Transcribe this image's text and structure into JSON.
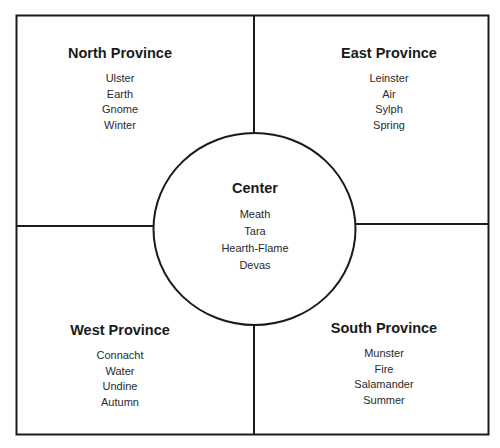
{
  "diagram": {
    "north": {
      "title": "North Province",
      "items": [
        "Ulster",
        "Earth",
        "Gnome",
        "Winter"
      ]
    },
    "east": {
      "title": "East Province",
      "items": [
        "Leinster",
        "Air",
        "Sylph",
        "Spring"
      ]
    },
    "center": {
      "title": "Center",
      "items": [
        "Meath",
        "Tara",
        "Hearth-Flame",
        "Devas"
      ]
    },
    "west": {
      "title": "West Province",
      "items": [
        "Connacht",
        "Water",
        "Undine",
        "Autumn"
      ]
    },
    "south": {
      "title": "South Province",
      "items": [
        "Munster",
        "Fire",
        "Salamander",
        "Summer"
      ]
    }
  },
  "colors": {
    "line": "#1a1a1a",
    "background": "#ffffff"
  }
}
